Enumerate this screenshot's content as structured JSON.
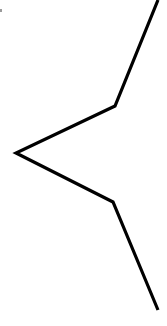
{
  "diagram": {
    "background": "#ffffff",
    "stroke_color": "#000000",
    "stroke_width": 3.2,
    "polyline_points": [
      [
        158,
        0
      ],
      [
        115,
        106
      ],
      [
        16,
        153
      ],
      [
        113,
        202
      ],
      [
        158,
        310
      ]
    ]
  }
}
